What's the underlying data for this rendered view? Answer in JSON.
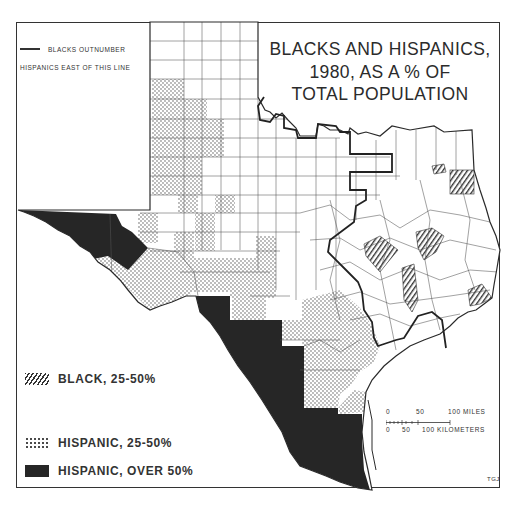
{
  "map": {
    "title_lines": [
      "BLACKS AND HISPANICS,",
      "1980, AS A % OF",
      "TOTAL POPULATION"
    ],
    "line_legend": {
      "line1": "BLACKS OUTNUMBER",
      "line2": "HISPANICS EAST OF THIS LINE"
    },
    "legend": [
      {
        "label": "BLACK, 25-50%",
        "pattern": "diagonal-hatch"
      },
      {
        "label": "HISPANIC, 25-50%",
        "pattern": "stipple-dots"
      },
      {
        "label": "HISPANIC, OVER 50%",
        "pattern": "solid-black"
      }
    ],
    "scale_bar": {
      "miles_labels": [
        "0",
        "50",
        "100 MILES"
      ],
      "km_labels": [
        "0",
        "50",
        "100 KILOMETERS"
      ]
    },
    "credit": "TGJ",
    "colors": {
      "ink": "#2a2a2a",
      "fill_over50": "#262626",
      "background": "#ffffff"
    }
  }
}
